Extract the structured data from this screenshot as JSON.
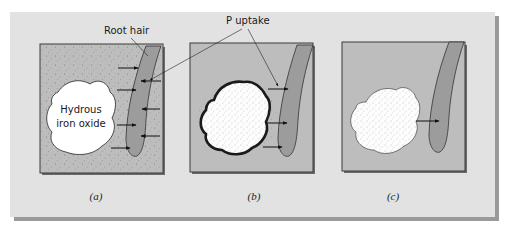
{
  "figure": {
    "labels": {
      "root_hair": "Root hair",
      "p_uptake": "P uptake",
      "oxide_line1": "Hydrous",
      "oxide_line2": "iron oxide"
    },
    "panels": [
      {
        "id": "a",
        "caption": "(a)",
        "description": "P adsorbed on oxide surface; uptake arrows toward root hair from soil"
      },
      {
        "id": "b",
        "caption": "(b)",
        "description": "Oxide with dark P-coated rim; uptake arrows to root hair"
      },
      {
        "id": "c",
        "caption": "(c)",
        "description": "Occluded P inside oxide; single arrow to root hair"
      }
    ],
    "colors": {
      "background_card": "#e2e2e2",
      "card_shadow": "#9a9a9a",
      "panel_soil": "#bdbdbd",
      "panel_border": "#3a3a3a",
      "root_fill": "#9c9c9c",
      "oxide_fill": "#ffffff",
      "arrow": "#111111"
    }
  }
}
